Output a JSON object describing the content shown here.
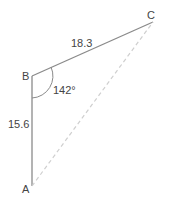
{
  "diagram": {
    "type": "triangle",
    "vertices": {
      "A": {
        "label": "A"
      },
      "B": {
        "label": "B"
      },
      "C": {
        "label": "C"
      }
    },
    "sides": {
      "AB": {
        "label": "15.6",
        "style": "solid"
      },
      "BC": {
        "label": "18.3",
        "style": "solid"
      },
      "AC": {
        "label": "",
        "style": "dashed"
      }
    },
    "angles": {
      "B": {
        "label": "142°"
      }
    },
    "colors": {
      "line": "#888888",
      "dashed": "#cccccc",
      "text": "#444444"
    }
  }
}
